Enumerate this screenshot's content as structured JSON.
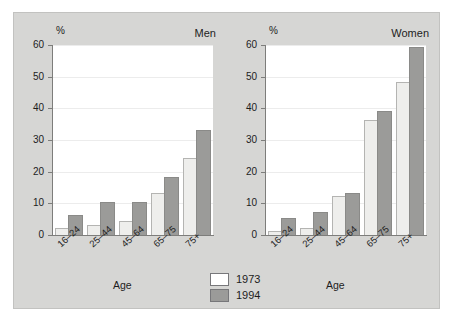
{
  "chart_data": {
    "type": "bar",
    "title": "",
    "xlabel": "Age",
    "ylabel": "%",
    "ylim": [
      0,
      60
    ],
    "yticks": [
      0,
      10,
      20,
      30,
      40,
      50,
      60
    ],
    "ytick_labels": [
      "0",
      "10",
      "20",
      "30",
      "40",
      "50",
      "60"
    ],
    "grid": true,
    "legend_position": "bottom-center",
    "categories": [
      "16–24",
      "25–44",
      "45–64",
      "65–75",
      "75+"
    ],
    "legend": [
      "1973",
      "1994"
    ],
    "panels": [
      {
        "title": "Men",
        "series": [
          {
            "name": "1973",
            "values": [
              2,
              3,
              4,
              13,
              24
            ]
          },
          {
            "name": "1994",
            "values": [
              6,
              10,
              10,
              18,
              33
            ]
          }
        ]
      },
      {
        "title": "Women",
        "series": [
          {
            "name": "1973",
            "values": [
              1,
              2,
              12,
              36,
              48
            ]
          },
          {
            "name": "1994",
            "values": [
              5,
              7,
              13,
              39,
              59
            ]
          }
        ]
      }
    ],
    "colors": {
      "series_1973": "#eeeeec",
      "series_1994": "#9b9b99",
      "plot_background": "#ffffff",
      "figure_background": "#d6d6d4",
      "axis": "#7d7d7b",
      "gridline": "#ececec",
      "text": "#1d1d1d"
    }
  },
  "legend": {
    "items": [
      {
        "label": "1973",
        "swatch": "legend-swatch-1973"
      },
      {
        "label": "1994",
        "swatch": "legend-swatch-1994"
      }
    ]
  }
}
